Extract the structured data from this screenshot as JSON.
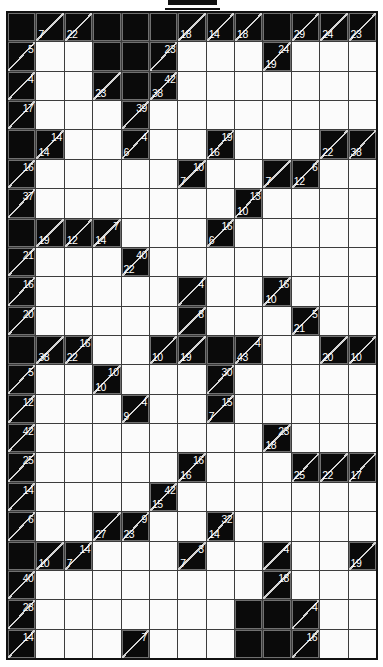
{
  "puzzle": {
    "type": "kakuro",
    "columns": 13,
    "rows": 22,
    "cell_legend": {
      "#": "solid black block",
      ".": "empty white entry cell",
      "a": "across clue (top-right of diagonal)",
      "d": "down clue (bottom-left of diagonal)"
    },
    "cells": [
      [
        "#",
        {
          "d": 7
        },
        {
          "d": 22
        },
        "#",
        "#",
        "#",
        {
          "d": 18
        },
        {
          "d": 14
        },
        {
          "d": 18
        },
        "#",
        {
          "d": 29
        },
        {
          "d": 24
        },
        {
          "d": 23
        }
      ],
      [
        {
          "a": 5
        },
        ".",
        ".",
        "#",
        "#",
        {
          "a": 23
        },
        ".",
        ".",
        ".",
        {
          "d": 19,
          "a": 24
        },
        ".",
        ".",
        "."
      ],
      [
        {
          "a": 4
        },
        ".",
        ".",
        {
          "d": 23
        },
        "#",
        {
          "d": 38,
          "a": 42
        },
        ".",
        ".",
        ".",
        ".",
        ".",
        ".",
        "."
      ],
      [
        {
          "a": 17
        },
        ".",
        ".",
        ".",
        {
          "a": 39
        },
        ".",
        ".",
        ".",
        ".",
        ".",
        ".",
        ".",
        "."
      ],
      [
        "#",
        {
          "d": 14,
          "a": 14
        },
        ".",
        ".",
        {
          "d": 6,
          "a": 4
        },
        ".",
        ".",
        {
          "d": 16,
          "a": 19
        },
        ".",
        ".",
        ".",
        {
          "d": 22
        },
        {
          "d": 38
        }
      ],
      [
        {
          "a": 16
        },
        ".",
        ".",
        ".",
        ".",
        ".",
        {
          "d": 7,
          "a": 10
        },
        ".",
        ".",
        {
          "d": 7
        },
        {
          "d": 12,
          "a": 6
        },
        ".",
        "."
      ],
      [
        {
          "a": 37
        },
        ".",
        ".",
        ".",
        ".",
        ".",
        ".",
        ".",
        {
          "d": 10,
          "a": 13
        },
        ".",
        ".",
        ".",
        "."
      ],
      [
        "#",
        {
          "d": 19
        },
        {
          "d": 12
        },
        {
          "d": 14,
          "a": 7
        },
        ".",
        ".",
        ".",
        {
          "d": 6,
          "a": 16
        },
        ".",
        ".",
        ".",
        ".",
        "."
      ],
      [
        {
          "a": 21
        },
        ".",
        ".",
        ".",
        {
          "d": 22,
          "a": 40
        },
        ".",
        ".",
        ".",
        ".",
        ".",
        ".",
        ".",
        "."
      ],
      [
        {
          "a": 16
        },
        ".",
        ".",
        ".",
        ".",
        ".",
        {
          "a": 4
        },
        ".",
        ".",
        {
          "d": 10,
          "a": 16
        },
        ".",
        ".",
        "."
      ],
      [
        {
          "a": 20
        },
        ".",
        ".",
        ".",
        ".",
        ".",
        {
          "a": 8
        },
        ".",
        ".",
        ".",
        {
          "d": 21,
          "a": 5
        },
        ".",
        "."
      ],
      [
        "#",
        {
          "d": 38
        },
        {
          "d": 22,
          "a": 16
        },
        ".",
        ".",
        {
          "d": 10
        },
        {
          "d": 19
        },
        "#",
        {
          "d": 43,
          "a": 4
        },
        ".",
        ".",
        {
          "d": 20
        },
        {
          "d": 10
        }
      ],
      [
        {
          "a": 5
        },
        ".",
        ".",
        {
          "d": 10,
          "a": 10
        },
        ".",
        ".",
        ".",
        {
          "a": 30
        },
        ".",
        ".",
        ".",
        ".",
        "."
      ],
      [
        {
          "a": 12
        },
        ".",
        ".",
        ".",
        {
          "d": 9,
          "a": 4
        },
        ".",
        ".",
        {
          "d": 7,
          "a": 15
        },
        ".",
        ".",
        ".",
        ".",
        "."
      ],
      [
        {
          "a": 42
        },
        ".",
        ".",
        ".",
        ".",
        ".",
        ".",
        ".",
        ".",
        {
          "d": 18,
          "a": 23
        },
        ".",
        ".",
        "."
      ],
      [
        {
          "a": 25
        },
        ".",
        ".",
        ".",
        ".",
        ".",
        {
          "d": 16,
          "a": 16
        },
        ".",
        ".",
        ".",
        {
          "d": 25
        },
        {
          "d": 22
        },
        {
          "d": 17
        }
      ],
      [
        {
          "a": 14
        },
        ".",
        ".",
        ".",
        ".",
        {
          "d": 15,
          "a": 42
        },
        ".",
        ".",
        ".",
        ".",
        ".",
        ".",
        "."
      ],
      [
        {
          "a": 6
        },
        ".",
        ".",
        {
          "d": 27
        },
        {
          "d": 23,
          "a": 9
        },
        ".",
        ".",
        {
          "d": 14,
          "a": 32
        },
        ".",
        ".",
        ".",
        ".",
        "."
      ],
      [
        "#",
        {
          "d": 10
        },
        {
          "d": 7,
          "a": 14
        },
        ".",
        ".",
        ".",
        {
          "d": 7,
          "a": 3
        },
        ".",
        ".",
        {
          "a": 4
        },
        ".",
        ".",
        {
          "d": 19
        }
      ],
      [
        {
          "a": 40
        },
        ".",
        ".",
        ".",
        ".",
        ".",
        ".",
        ".",
        ".",
        {
          "a": 18
        },
        ".",
        ".",
        "."
      ],
      [
        {
          "a": 28
        },
        ".",
        ".",
        ".",
        ".",
        ".",
        ".",
        ".",
        "#",
        "#",
        {
          "a": 4
        },
        ".",
        "."
      ],
      [
        {
          "a": 14
        },
        ".",
        ".",
        ".",
        {
          "a": 7
        },
        ".",
        ".",
        ".",
        "#",
        "#",
        {
          "a": 16
        },
        ".",
        "."
      ]
    ]
  },
  "colors": {
    "background": "#ffffff",
    "block": "#0a0a0a",
    "grid_line": "#3c3c3c",
    "cell_background": "#fbfbfb",
    "clue_text": "#ffffff",
    "diagonal": "#d4d4d4",
    "outer_border": "#111111"
  }
}
